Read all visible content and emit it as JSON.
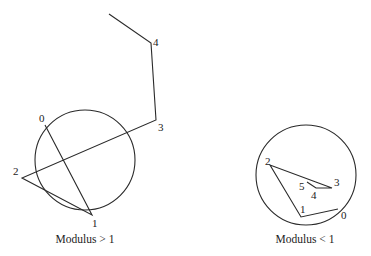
{
  "figures": [
    {
      "id": "modulus-greater-than-one",
      "caption": "Modulus > 1",
      "unit_circle": {
        "cx": 85,
        "cy": 160,
        "r": 50
      },
      "path_points": [
        {
          "label": "0",
          "x": 45,
          "y": 125
        },
        {
          "label": "1",
          "x": 92,
          "y": 215
        },
        {
          "label": "2",
          "x": 22,
          "y": 178
        },
        {
          "label": "3",
          "x": 156,
          "y": 120
        },
        {
          "label": "4",
          "x": 151,
          "y": 43
        },
        {
          "label": "",
          "x": 109,
          "y": 14
        }
      ],
      "labels": [
        {
          "text": "0",
          "x": 39,
          "y": 122
        },
        {
          "text": "1",
          "x": 92,
          "y": 227
        },
        {
          "text": "2",
          "x": 13,
          "y": 175
        },
        {
          "text": "3",
          "x": 158,
          "y": 131
        },
        {
          "text": "4",
          "x": 153,
          "y": 46
        }
      ],
      "caption_pos": {
        "x": 85,
        "y": 243
      }
    },
    {
      "id": "modulus-less-than-one",
      "caption": "Modulus < 1",
      "unit_circle": {
        "cx": 306,
        "cy": 175,
        "r": 50
      },
      "path_points": [
        {
          "label": "0",
          "x": 338,
          "y": 209
        },
        {
          "label": "1",
          "x": 301,
          "y": 217
        },
        {
          "label": "2",
          "x": 270,
          "y": 165
        },
        {
          "label": "3",
          "x": 332,
          "y": 188
        },
        {
          "label": "4",
          "x": 316,
          "y": 188
        },
        {
          "label": "5",
          "x": 307,
          "y": 182
        }
      ],
      "labels": [
        {
          "text": "0",
          "x": 341,
          "y": 219
        },
        {
          "text": "1",
          "x": 300,
          "y": 213
        },
        {
          "text": "2",
          "x": 265,
          "y": 165
        },
        {
          "text": "3",
          "x": 334,
          "y": 186
        },
        {
          "text": "4",
          "x": 311,
          "y": 199
        },
        {
          "text": "5",
          "x": 299,
          "y": 190
        }
      ],
      "caption_pos": {
        "x": 305,
        "y": 243
      }
    }
  ]
}
